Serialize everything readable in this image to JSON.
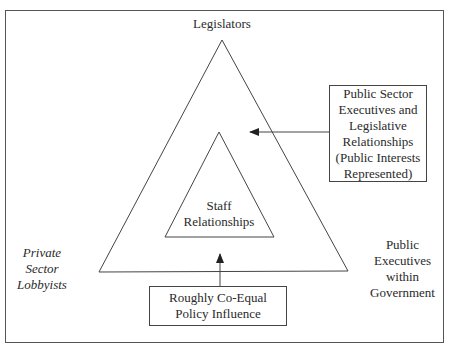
{
  "diagram": {
    "top_label": "Legislators",
    "inner_label": [
      "Staff",
      "Relationships"
    ],
    "left_label": [
      "Private",
      "Sector",
      "Lobbyists"
    ],
    "right_label": [
      "Public",
      "Executives",
      "within",
      "Government"
    ],
    "right_box": [
      "Public Sector",
      "Executives and",
      "Legislative",
      "Relationships",
      "(Public Interests",
      "Represented)"
    ],
    "bottom_box": [
      "Roughly Co-Equal",
      "Policy Influence"
    ],
    "colors": {
      "line": "#444444",
      "frame": "#555555",
      "background": "#ffffff"
    },
    "arrows": [
      {
        "from": "right_box",
        "to": "inner_triangle",
        "direction": "left"
      },
      {
        "from": "bottom_box",
        "to": "inner_triangle",
        "direction": "up"
      }
    ]
  }
}
